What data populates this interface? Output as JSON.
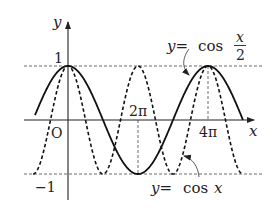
{
  "diagram": {
    "type": "function-graph",
    "axes": {
      "x_label": "x",
      "y_label": "y",
      "origin_label": "O",
      "x_ticks": [
        "2π",
        "4π"
      ],
      "y_ticks": [
        "1",
        "−1"
      ]
    },
    "curves": [
      {
        "name": "cos-x-over-2",
        "style": "solid",
        "label_lhs": "y=",
        "label_fn": "cos",
        "label_num": "x",
        "label_den": "2"
      },
      {
        "name": "cos-x",
        "style": "dashed",
        "label_lhs": "y=",
        "label_fn": "cos",
        "label_arg": "x"
      }
    ],
    "guides": [
      "y = 1 dashed",
      "y = −1 dashed",
      "x = 2π dashed",
      "x = 4π dashed"
    ]
  },
  "chart_data": {
    "type": "line",
    "title": "",
    "xlabel": "x",
    "ylabel": "y",
    "xlim": [
      "-π",
      "5π"
    ],
    "ylim": [
      -1,
      1
    ],
    "x_tick_labels": [
      "O",
      "2π",
      "4π"
    ],
    "y_tick_labels": [
      "1",
      "−1"
    ],
    "series": [
      {
        "name": "y=cos(x/2)",
        "style": "solid",
        "period": "4π",
        "points": [
          [
            -3.14,
            0
          ],
          [
            0,
            1
          ],
          [
            3.14,
            0
          ],
          [
            6.28,
            -1
          ],
          [
            9.42,
            0
          ],
          [
            12.57,
            1
          ],
          [
            15.71,
            0
          ]
        ]
      },
      {
        "name": "y=cos x",
        "style": "dashed",
        "period": "2π",
        "points": [
          [
            -3.14,
            -1
          ],
          [
            0,
            1
          ],
          [
            3.14,
            -1
          ],
          [
            6.28,
            1
          ],
          [
            9.42,
            -1
          ],
          [
            12.57,
            1
          ],
          [
            15.71,
            -1
          ]
        ]
      }
    ],
    "grid": false,
    "legend": "inline annotations"
  }
}
